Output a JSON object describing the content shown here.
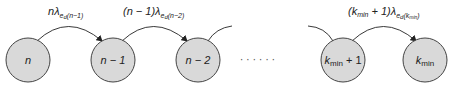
{
  "nodes": [
    {
      "id": "n",
      "label": "n",
      "cx": 28
    },
    {
      "id": "n-1",
      "label": "n − 1",
      "cx": 113
    },
    {
      "id": "n-2",
      "label": "n − 2",
      "cx": 198
    },
    {
      "id": "kmin+1",
      "label": "k",
      "sub": "min",
      "suffix": " + 1",
      "cx": 343
    },
    {
      "id": "kmin",
      "label": "k",
      "sub": "min",
      "cx": 425
    }
  ],
  "ellipsis": "· · · · · ·",
  "transitions": [
    {
      "from": "n",
      "to": "n-1",
      "coef": "n",
      "rate": "λ",
      "rate_sub": "e",
      "rate_sub2": "d",
      "index": "(n−1)"
    },
    {
      "from": "n-1",
      "to": "n-2",
      "coef": "(n − 1)",
      "rate": "λ",
      "rate_sub": "e",
      "rate_sub2": "d",
      "index": "(n−2)"
    },
    {
      "from": "kmin+1",
      "to": "kmin",
      "coef": "(k",
      "coef_sub": "min",
      "coef_suffix": " + 1)",
      "rate": "λ",
      "rate_sub": "e",
      "rate_sub2": "d",
      "index": "(k",
      "index_sub": "min",
      "index_suffix": ")"
    }
  ],
  "colors": {
    "node_fill": "#d9d9d9",
    "stroke": "#444444"
  }
}
